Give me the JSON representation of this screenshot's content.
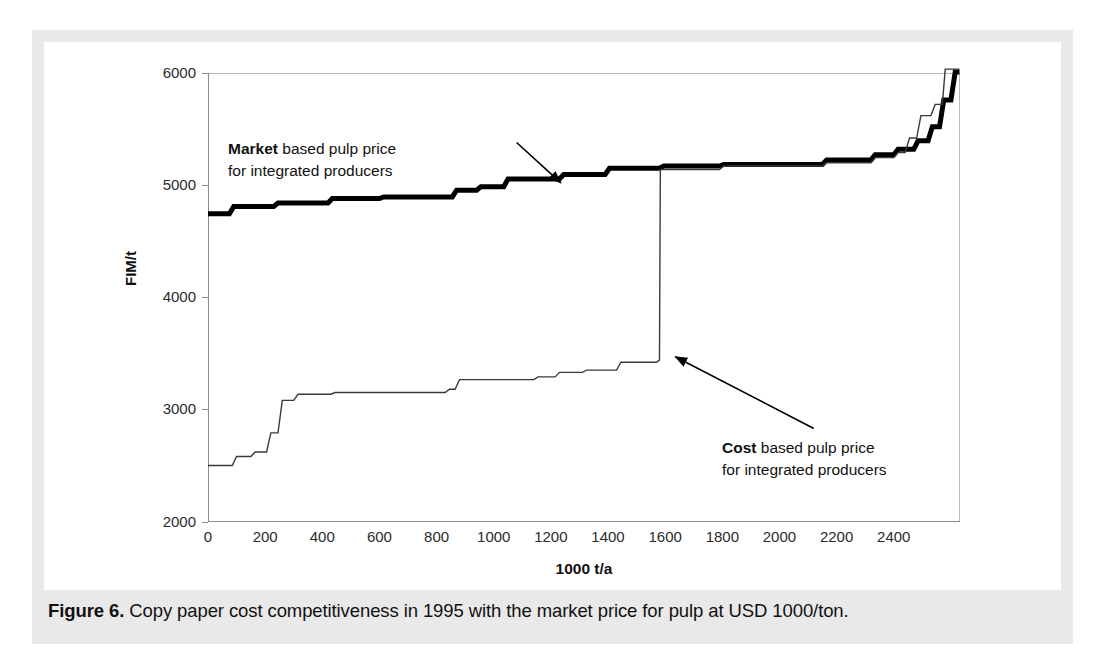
{
  "caption": {
    "figure_label": "Figure 6.",
    "text": " Copy paper cost competitiveness in 1995 with the market price for pulp at USD 1000/ton."
  },
  "annotations": {
    "market": {
      "bold": "Market",
      "line1_rest": " based pulp price",
      "line2": "for integrated producers"
    },
    "cost": {
      "bold": "Cost",
      "line1_rest": " based pulp price",
      "line2": "for integrated producers"
    }
  },
  "chart_data": {
    "type": "line",
    "title": "",
    "subtitle": "",
    "xlabel": "1000 t/a",
    "ylabel": "FIM/t",
    "xlim": [
      0,
      2630
    ],
    "ylim": [
      2000,
      6000
    ],
    "xticks": [
      0,
      200,
      400,
      600,
      800,
      1000,
      1200,
      1400,
      1600,
      1800,
      2000,
      2200,
      2400
    ],
    "yticks": [
      2000,
      3000,
      4000,
      5000,
      6000
    ],
    "grid": false,
    "legend": "none (inline annotations with arrows)",
    "series": [
      {
        "name": "Market based pulp price for integrated producers",
        "style": "thick-black-step",
        "line_width_px": 5,
        "color": "#000000",
        "points": [
          [
            0,
            4745
          ],
          [
            75,
            4745
          ],
          [
            90,
            4810
          ],
          [
            230,
            4810
          ],
          [
            245,
            4840
          ],
          [
            420,
            4840
          ],
          [
            435,
            4880
          ],
          [
            600,
            4880
          ],
          [
            615,
            4895
          ],
          [
            855,
            4895
          ],
          [
            870,
            4955
          ],
          [
            940,
            4955
          ],
          [
            955,
            4985
          ],
          [
            1035,
            4985
          ],
          [
            1050,
            5055
          ],
          [
            1230,
            5055
          ],
          [
            1245,
            5095
          ],
          [
            1390,
            5095
          ],
          [
            1405,
            5150
          ],
          [
            1580,
            5150
          ],
          [
            1595,
            5170
          ],
          [
            1790,
            5170
          ],
          [
            1805,
            5185
          ],
          [
            2150,
            5185
          ],
          [
            2165,
            5225
          ],
          [
            2320,
            5225
          ],
          [
            2335,
            5270
          ],
          [
            2400,
            5270
          ],
          [
            2415,
            5320
          ],
          [
            2470,
            5320
          ],
          [
            2485,
            5395
          ],
          [
            2520,
            5395
          ],
          [
            2535,
            5520
          ],
          [
            2560,
            5520
          ],
          [
            2575,
            5760
          ],
          [
            2600,
            5760
          ],
          [
            2615,
            6010
          ],
          [
            2630,
            6010
          ]
        ]
      },
      {
        "name": "Cost based pulp price for integrated producers",
        "style": "thin-black-step",
        "line_width_px": 1.4,
        "color": "#3a3a3a",
        "points": [
          [
            0,
            2500
          ],
          [
            85,
            2500
          ],
          [
            100,
            2580
          ],
          [
            150,
            2580
          ],
          [
            165,
            2620
          ],
          [
            205,
            2620
          ],
          [
            220,
            2790
          ],
          [
            245,
            2790
          ],
          [
            260,
            3080
          ],
          [
            300,
            3080
          ],
          [
            315,
            3135
          ],
          [
            430,
            3135
          ],
          [
            445,
            3150
          ],
          [
            830,
            3150
          ],
          [
            845,
            3180
          ],
          [
            865,
            3180
          ],
          [
            880,
            3265
          ],
          [
            1140,
            3265
          ],
          [
            1155,
            3290
          ],
          [
            1215,
            3290
          ],
          [
            1230,
            3330
          ],
          [
            1310,
            3330
          ],
          [
            1325,
            3350
          ],
          [
            1430,
            3350
          ],
          [
            1445,
            3420
          ],
          [
            1570,
            3420
          ],
          [
            1580,
            3440
          ],
          [
            1583,
            5140
          ],
          [
            1790,
            5140
          ],
          [
            1805,
            5170
          ],
          [
            2150,
            5170
          ],
          [
            2165,
            5200
          ],
          [
            2320,
            5200
          ],
          [
            2335,
            5245
          ],
          [
            2400,
            5245
          ],
          [
            2415,
            5290
          ],
          [
            2440,
            5290
          ],
          [
            2455,
            5420
          ],
          [
            2480,
            5420
          ],
          [
            2495,
            5620
          ],
          [
            2530,
            5620
          ],
          [
            2545,
            5720
          ],
          [
            2570,
            5720
          ],
          [
            2580,
            6035
          ],
          [
            2630,
            6035
          ]
        ]
      }
    ],
    "arrows": [
      {
        "name": "market-arrow",
        "from": [
          1080,
          5380
        ],
        "to": [
          1235,
          5020
        ],
        "target_series": "Market based pulp price for integrated producers"
      },
      {
        "name": "cost-arrow",
        "from": [
          2120,
          2830
        ],
        "to": [
          1635,
          3470
        ],
        "target_series": "Cost based pulp price for integrated producers"
      }
    ]
  }
}
